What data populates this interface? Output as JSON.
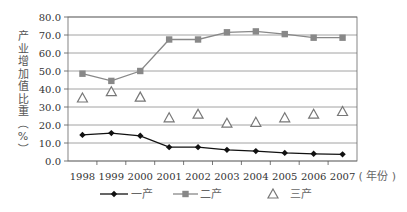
{
  "chart_data": {
    "type": "line",
    "title": "",
    "xlabel": "年份",
    "ylabel": "产业增加值比重（%）",
    "ylim": [
      0,
      80
    ],
    "yticks": [
      "0.0",
      "10.0",
      "20.0",
      "30.0",
      "40.0",
      "50.0",
      "60.0",
      "70.0",
      "80.0"
    ],
    "grid": true,
    "legend_position": "bottom",
    "categories": [
      "1998",
      "1999",
      "2000",
      "2001",
      "2002",
      "2003",
      "2004",
      "2005",
      "2006",
      "2007"
    ],
    "x_suffix": "( 年份 )",
    "series": [
      {
        "name": "一产",
        "marker": "diamond",
        "line": true,
        "color": "#111111",
        "values": [
          14.5,
          15.5,
          14.0,
          7.7,
          7.7,
          6.2,
          5.5,
          4.5,
          4.0,
          3.7
        ]
      },
      {
        "name": "二产",
        "marker": "square",
        "line": true,
        "color": "#888888",
        "values": [
          48.5,
          44.5,
          50.0,
          67.5,
          67.5,
          71.5,
          72.0,
          70.5,
          68.5,
          68.5
        ]
      },
      {
        "name": "三产",
        "marker": "triangle",
        "line": false,
        "color": "#777777",
        "values": [
          35.0,
          38.5,
          35.5,
          24.0,
          26.0,
          21.0,
          21.5,
          24.0,
          26.0,
          27.5
        ]
      }
    ]
  }
}
